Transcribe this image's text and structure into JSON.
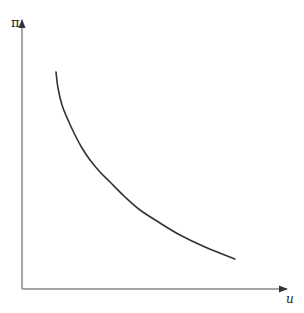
{
  "chart_data": {
    "type": "line",
    "title": "",
    "xlabel": "u",
    "ylabel": "π",
    "x_ticks": [],
    "y_ticks": [],
    "grid": false,
    "legend": null,
    "series": [
      {
        "name": "curve",
        "color": "#333333",
        "points_px": [
          [
            56,
            72
          ],
          [
            58,
            88
          ],
          [
            62,
            105
          ],
          [
            68,
            120
          ],
          [
            75,
            135
          ],
          [
            82,
            148
          ],
          [
            90,
            160
          ],
          [
            100,
            172
          ],
          [
            110,
            182
          ],
          [
            125,
            197
          ],
          [
            140,
            210
          ],
          [
            160,
            223
          ],
          [
            180,
            235
          ],
          [
            205,
            247
          ],
          [
            235,
            259
          ]
        ]
      }
    ],
    "axes": {
      "origin_px": [
        22,
        289
      ],
      "x_axis_end_px": [
        287,
        289
      ],
      "y_axis_end_px": [
        22,
        20
      ],
      "color": "#888888"
    }
  },
  "labels": {
    "y_axis": "π",
    "x_axis": "u"
  }
}
